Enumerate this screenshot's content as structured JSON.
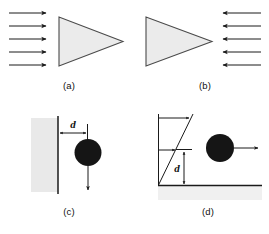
{
  "figure": {
    "title": "",
    "background_color": "#ffffff",
    "ink_color": "#1a1a1a",
    "wedge_fill_color": "#ebebeb",
    "wedge_edge_color": "#4a4a4a",
    "disc_color": "#151515",
    "wall_fill_color": "#e9e9e9",
    "ground_fill_color": "#f0f0f0",
    "panels": [
      {
        "id": "a",
        "caption": "(a)",
        "description": "uniform flow from left onto a wedge pointing right",
        "flow_arrow_count": 5,
        "flow_direction": "right",
        "arrows_side": "left",
        "wedge_apex_direction": "right"
      },
      {
        "id": "b",
        "caption": "(b)",
        "description": "uniform flow from right onto a wedge pointing right",
        "flow_arrow_count": 5,
        "flow_direction": "left",
        "arrows_side": "right",
        "wedge_apex_direction": "right"
      },
      {
        "id": "c",
        "caption": "(c)",
        "description": "disc falling downward parallel to a vertical wall at distance d",
        "dimension_label": "d",
        "dimension_orientation": "horizontal",
        "boundary": "vertical wall",
        "boundary_side": "left",
        "motion_arrow_direction": "down"
      },
      {
        "id": "d",
        "caption": "(d)",
        "description": "disc moving to the right in a linear shear flow at height d above the ground",
        "dimension_label": "d",
        "dimension_orientation": "vertical",
        "boundary": "horizontal ground",
        "boundary_side": "bottom",
        "motion_arrow_direction": "right",
        "velocity_profile": "linear shear",
        "profile_arrow_count": 2
      }
    ]
  }
}
